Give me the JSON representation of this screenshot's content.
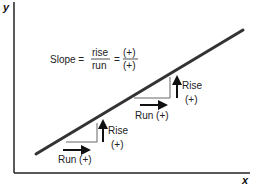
{
  "diagram": {
    "type": "slope-diagram",
    "axes": {
      "x_label": "x",
      "y_label": "y"
    },
    "formula": {
      "prefix": "Slope =",
      "fraction1": {
        "numerator": "rise",
        "denominator": "run"
      },
      "equals": "=",
      "fraction2": {
        "numerator": "(+)",
        "denominator": "(+)"
      }
    },
    "annotations": {
      "lower": {
        "rise_label": "Rise",
        "rise_sign": "(+)",
        "run_label": "Run (+)"
      },
      "upper": {
        "rise_label": "Rise",
        "rise_sign": "(+)",
        "run_label": "Run (+)"
      }
    },
    "colors": {
      "line": "#333333",
      "axis": "#222222",
      "triangle": "#555555",
      "arrow": "#111111"
    }
  }
}
